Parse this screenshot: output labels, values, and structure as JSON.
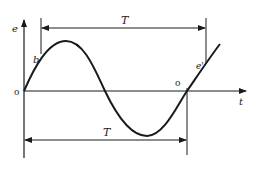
{
  "diagram": {
    "type": "sinusoidal waveform with period markers",
    "axes": {
      "y_label": "e",
      "x_label": "t",
      "origin_label": "o"
    },
    "curve": {
      "shape": "sine",
      "description": "starts at origin, rises to positive peak, crosses zero, falls to negative trough, crosses zero again and rises"
    },
    "points": {
      "b_label": "b",
      "e_prime_label": "e'",
      "second_zero_label": "o"
    },
    "period_markers": {
      "top_label": "T",
      "bottom_label": "T"
    },
    "colors": {
      "line": "#1a1a1a",
      "background": "#ffffff"
    }
  }
}
